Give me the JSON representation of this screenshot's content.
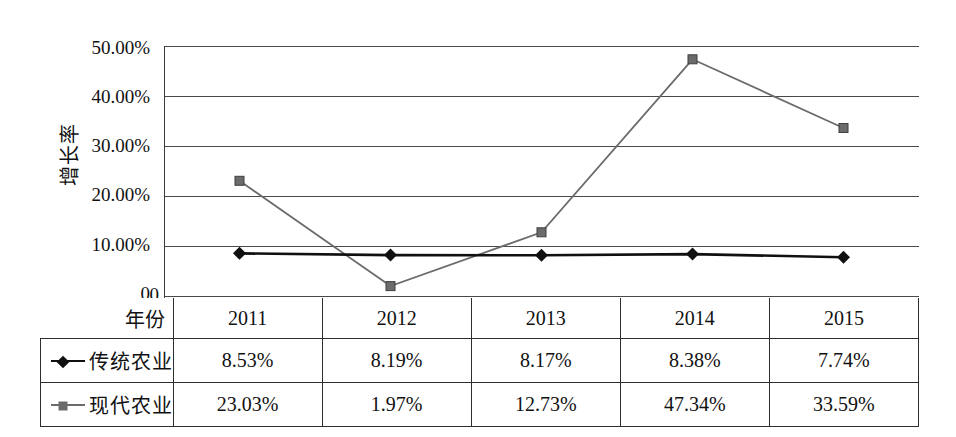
{
  "chart_data": {
    "type": "line",
    "title": "",
    "xlabel": "年份",
    "ylabel": "增长率",
    "categories": [
      "2011",
      "2012",
      "2013",
      "2014",
      "2015"
    ],
    "ylim": [
      0,
      50
    ],
    "ytick_labels": [
      "50.00%",
      "40.00%",
      "30.00%",
      "20.00%",
      "10.00%",
      "0"
    ],
    "ytick_values": [
      50,
      40,
      30,
      20,
      10,
      0
    ],
    "grid": true,
    "legend_position": "table-left",
    "series": [
      {
        "name": "传统农业",
        "marker": "diamond",
        "color": "#101010",
        "values": [
          8.53,
          8.19,
          8.17,
          8.38,
          7.74
        ],
        "labels": [
          "8.53%",
          "8.19%",
          "8.17%",
          "8.38%",
          "7.74%"
        ]
      },
      {
        "name": "现代农业",
        "marker": "square",
        "color": "#6b6b6b",
        "values": [
          23.03,
          1.97,
          12.73,
          47.34,
          33.59
        ],
        "labels": [
          "23.03%",
          "1.97%",
          "12.73%",
          "47.34%",
          "33.59%"
        ]
      }
    ]
  },
  "table": {
    "row_header_label": "年份",
    "columns": [
      "2011",
      "2012",
      "2013",
      "2014",
      "2015"
    ],
    "rows": [
      {
        "label": "传统农业",
        "marker": "diamond",
        "values": [
          "8.53%",
          "8.19%",
          "8.17%",
          "8.38%",
          "7.74%"
        ]
      },
      {
        "label": "现代农业",
        "marker": "square",
        "values": [
          "23.03%",
          "1.97%",
          "12.73%",
          "47.34%",
          "33.59%"
        ]
      }
    ]
  },
  "axis": {
    "y_title": "增长率",
    "ticks": [
      "50.00%",
      "40.00%",
      "30.00%",
      "20.00%",
      "10.00%",
      "0"
    ]
  }
}
